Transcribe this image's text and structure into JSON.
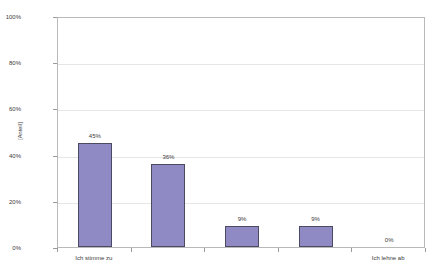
{
  "chart_data": {
    "type": "bar",
    "title": "",
    "subtitle": "",
    "xlabel": "",
    "ylabel": "[Anteil]",
    "categories": [
      "Ich stimme zu",
      "",
      "",
      "",
      "Ich lehne ab"
    ],
    "visible_category_labels": [
      {
        "index": 0,
        "text": "Ich stimme zu"
      },
      {
        "index": 4,
        "text": "Ich lehne ab"
      }
    ],
    "values": [
      45,
      36,
      9,
      9,
      0
    ],
    "data_labels": [
      "45%",
      "36%",
      "9%",
      "9%",
      "0%"
    ],
    "ylim": [
      0,
      100
    ],
    "ytick_values": [
      0,
      20,
      40,
      60,
      80,
      100
    ],
    "ytick_labels": [
      "0%",
      "20%",
      "40%",
      "60%",
      "80%",
      "100%"
    ],
    "grid": "horizontal",
    "legend": "none",
    "bar_fill_color": "#8f8ac4",
    "bar_border_color": "#4a4a63",
    "gridline_color": "#e6e6e6",
    "plot_border_color": "#b9b9b9",
    "background_color": "#ffffff"
  }
}
